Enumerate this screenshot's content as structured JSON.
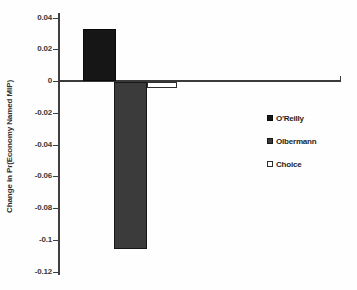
{
  "chart_data": {
    "type": "bar",
    "title": "",
    "xlabel": "",
    "ylabel": "Change in Pr(Economy Named MIP)",
    "ylim": [
      -0.12,
      0.04
    ],
    "grid": false,
    "legend_position": "right",
    "yticks": [
      0.04,
      0.02,
      0,
      -0.02,
      -0.04,
      -0.06,
      -0.08,
      -0.1,
      -0.12
    ],
    "ytick_labels": [
      "0.04",
      "0.02",
      "0",
      "-0.02",
      "-0.04",
      "-0.06",
      "-0.08",
      "-0.1",
      "-0.12"
    ],
    "categories": [
      "O'Reilly",
      "Olbermann",
      "Choice"
    ],
    "series": [
      {
        "name": "O'Reilly",
        "value": 0.033,
        "fill": "#161616",
        "border": "#0a0a0a"
      },
      {
        "name": "Olbermann",
        "value": -0.105,
        "fill": "#3b3b3b",
        "border": "#161616"
      },
      {
        "name": "Choice",
        "value": -0.004,
        "fill": "#ffffff",
        "border": "#2e2e2e"
      }
    ],
    "axis_color": "#3a3a3a",
    "background": "#fefefe"
  }
}
